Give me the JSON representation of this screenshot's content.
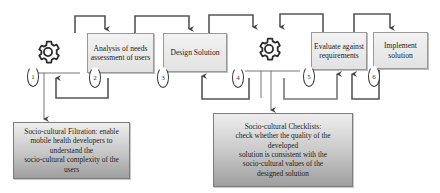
{
  "diagram": {
    "type": "process-flow",
    "steps": [
      {
        "id": 1,
        "label": "1",
        "kind": "gear-icon",
        "text": ""
      },
      {
        "id": 2,
        "label": "2",
        "kind": "box",
        "text": "Analysis of needs assessment of users"
      },
      {
        "id": 3,
        "label": "3",
        "kind": "box",
        "text": "Design Solution"
      },
      {
        "id": 4,
        "label": "4",
        "kind": "gear-icon",
        "text": ""
      },
      {
        "id": 5,
        "label": "5",
        "kind": "box",
        "text": "Evaluate against requirements"
      },
      {
        "id": 6,
        "label": "6",
        "kind": "box",
        "text": "Implement solution"
      }
    ],
    "notes": {
      "filtration": "Socio-cultural Filtration: enable\nmobile health developers to\nunderstand the\nsocio-cultural complexity of the\nusers",
      "checklists": "Socio-cultural Checklists:\ncheck whether the quality of the\ndeveloped\nsolution is consistent with the\nsocio-cultural values of  the\ndesigned solution"
    },
    "colors": {
      "line": "#3a3a3a",
      "box_fill": "#e8e8e8",
      "note_fill_top": "#eeeeee",
      "note_fill_bottom": "#9e9e9e"
    }
  }
}
